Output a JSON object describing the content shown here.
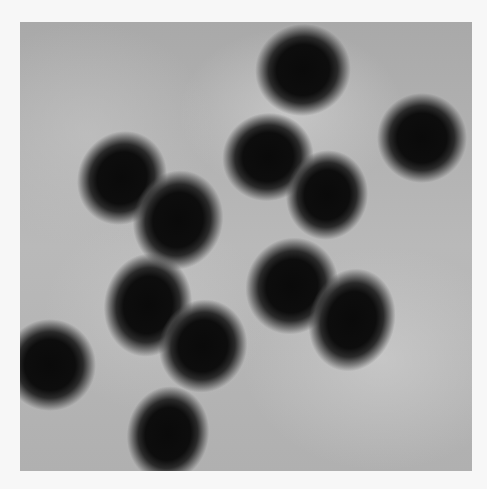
{
  "image": {
    "description": "Grayscale micrograph of dark oval particles on a gray background",
    "background_color": "#b4b4b4",
    "border_color": "#f7f7f7",
    "particles": [
      {
        "cx": 283,
        "cy": 48,
        "w": 72,
        "h": 68,
        "rot": -15
      },
      {
        "cx": 402,
        "cy": 116,
        "w": 66,
        "h": 66,
        "rot": 0
      },
      {
        "cx": 248,
        "cy": 135,
        "w": 68,
        "h": 64,
        "rot": -20
      },
      {
        "cx": 102,
        "cy": 156,
        "w": 64,
        "h": 72,
        "rot": 30
      },
      {
        "cx": 307,
        "cy": 173,
        "w": 58,
        "h": 66,
        "rot": 10
      },
      {
        "cx": 158,
        "cy": 198,
        "w": 66,
        "h": 76,
        "rot": 15
      },
      {
        "cx": 272,
        "cy": 264,
        "w": 68,
        "h": 74,
        "rot": 25
      },
      {
        "cx": 128,
        "cy": 283,
        "w": 64,
        "h": 80,
        "rot": 10
      },
      {
        "cx": 332,
        "cy": 298,
        "w": 62,
        "h": 80,
        "rot": 15
      },
      {
        "cx": 183,
        "cy": 324,
        "w": 64,
        "h": 70,
        "rot": 20
      },
      {
        "cx": 30,
        "cy": 343,
        "w": 68,
        "h": 68,
        "rot": 0
      },
      {
        "cx": 148,
        "cy": 412,
        "w": 58,
        "h": 72,
        "rot": 10
      }
    ]
  }
}
